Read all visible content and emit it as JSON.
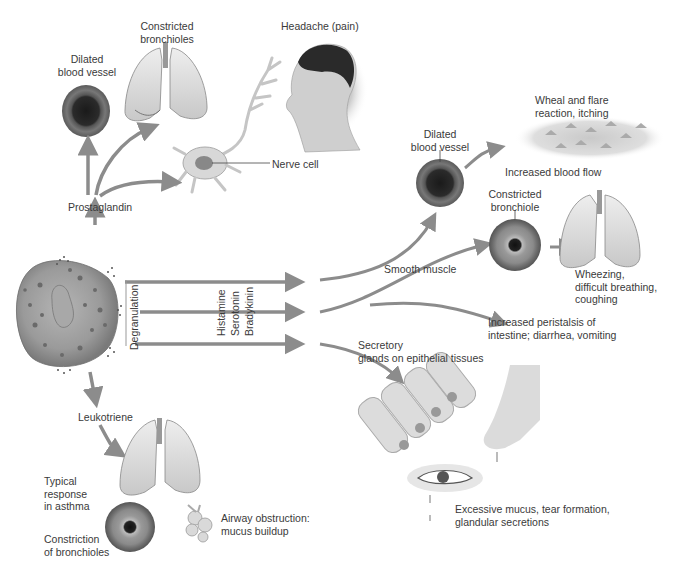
{
  "colors": {
    "arrow": "#8c8c8c",
    "vessel_outer": "#6e6e6e",
    "vessel_lumen": "#222222",
    "lung": "#d9d9d9",
    "cell_body": "#9a9a9a",
    "text": "#3a3a3a"
  },
  "source_cell": {
    "name": "Mast cell",
    "process_label": "Degranulation",
    "mediators": [
      "Histamine",
      "Serotonin",
      "Bradykinin"
    ]
  },
  "prostaglandin_branch": {
    "label": "Prostaglandin",
    "targets": [
      {
        "label": "Dilated\nblood vessel"
      },
      {
        "label": "Constricted\nbronchioles"
      },
      {
        "label": "Nerve cell"
      },
      {
        "label": "Headache (pain)"
      }
    ]
  },
  "leukotriene_branch": {
    "label": "Leukotriene",
    "response_label": "Typical\nresponse\nin asthma",
    "constriction_label": "Constriction\nof bronchioles",
    "obstruction_label": "Airway obstruction:\nmucus buildup"
  },
  "smooth_muscle_branch": {
    "label": "Smooth muscle",
    "dilated_vessel_label": "Dilated\nblood vessel",
    "wheal_label": "Wheal and flare\nreaction, itching",
    "blood_flow_label": "Increased blood flow",
    "constricted_bronchiole_label": "Constricted\nbronchiole",
    "wheezing_label": "Wheezing,\ndifficult breathing,\ncoughing",
    "peristalsis_label": "Increased peristalsis of\nintestine; diarrhea, vomiting"
  },
  "secretory_branch": {
    "label": "Secretory\n glands on epithelial tissues",
    "result_label": "Excessive mucus, tear formation,\nglandular secretions"
  }
}
